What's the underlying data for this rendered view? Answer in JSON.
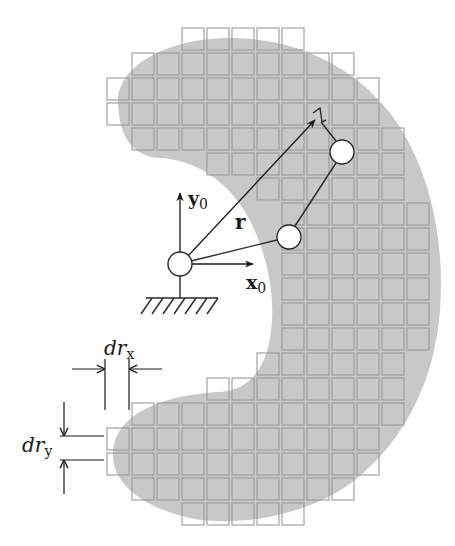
{
  "figure": {
    "colors": {
      "workspace_fill": "#c8c8c8",
      "cell_stroke": "#9a9a9a",
      "line": "#2a2a2a",
      "joint_fill": "#ffffff"
    },
    "labels": {
      "y_axis": "y",
      "y_axis_sub": "0",
      "x_axis": "x",
      "x_axis_sub": "0",
      "position_vector": "r",
      "dr_x_main": "dr",
      "dr_x_sub": "x",
      "dr_y_main": "dr",
      "dr_y_sub": "y"
    },
    "grid": {
      "origin_x": 107,
      "origin_y": 28,
      "pitch": 25,
      "cell_size": 22,
      "rows": [
        {
          "row": 0,
          "col_start": 3,
          "col_end": 7
        },
        {
          "row": 1,
          "col_start": 1,
          "col_end": 9
        },
        {
          "row": 2,
          "col_start": 0,
          "col_end": 10
        },
        {
          "row": 3,
          "col_start": 0,
          "col_end": 10
        },
        {
          "row": 4,
          "col_start": 1,
          "col_end": 11
        },
        {
          "row": 5,
          "col_start": 4,
          "col_end": 11
        },
        {
          "row": 6,
          "col_start": 6,
          "col_end": 11
        },
        {
          "row": 7,
          "col_start": 7,
          "col_end": 12
        },
        {
          "row": 8,
          "col_start": 7,
          "col_end": 12
        },
        {
          "row": 9,
          "col_start": 7,
          "col_end": 12
        },
        {
          "row": 10,
          "col_start": 7,
          "col_end": 12
        },
        {
          "row": 11,
          "col_start": 7,
          "col_end": 12
        },
        {
          "row": 12,
          "col_start": 7,
          "col_end": 12
        },
        {
          "row": 13,
          "col_start": 6,
          "col_end": 11
        },
        {
          "row": 14,
          "col_start": 4,
          "col_end": 11
        },
        {
          "row": 15,
          "col_start": 1,
          "col_end": 11
        },
        {
          "row": 16,
          "col_start": 0,
          "col_end": 10
        },
        {
          "row": 17,
          "col_start": 0,
          "col_end": 10
        },
        {
          "row": 18,
          "col_start": 1,
          "col_end": 9
        },
        {
          "row": 19,
          "col_start": 3,
          "col_end": 7
        }
      ]
    },
    "robot": {
      "base": {
        "x": 180,
        "y": 264,
        "r": 12
      },
      "joint2": {
        "x": 289,
        "y": 237,
        "r": 12
      },
      "joint3": {
        "x": 342,
        "y": 152,
        "r": 12
      },
      "end_effector": {
        "x": 316,
        "y": 119
      }
    }
  }
}
